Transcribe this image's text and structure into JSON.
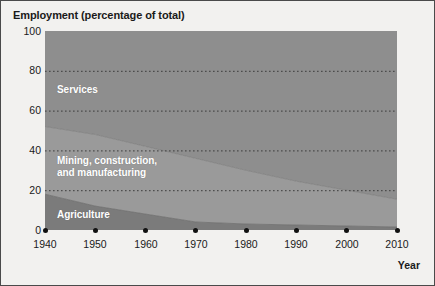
{
  "chart_data": {
    "type": "area",
    "title": "Employment (percentage of total)",
    "xlabel": "Year",
    "ylabel": "Employment (percentage of total)",
    "x": [
      1940,
      1950,
      1960,
      1970,
      1980,
      1990,
      2000,
      2010
    ],
    "xlim": [
      1940,
      2010
    ],
    "ylim": [
      0,
      100
    ],
    "xticks": [
      "1940",
      "1950",
      "1960",
      "1970",
      "1980",
      "1990",
      "2000",
      "2010"
    ],
    "yticks": [
      "0",
      "20",
      "40",
      "60",
      "80",
      "100"
    ],
    "grid": true,
    "grid_style": "dotted-horizontal",
    "legend": "inline-labels",
    "stacked": true,
    "stack_order_bottom_to_top": [
      "Agriculture",
      "Mining, construction, and manufacturing",
      "Services"
    ],
    "series": [
      {
        "name": "Agriculture",
        "color": "#7d7d7d",
        "values": [
          18,
          12,
          8,
          4,
          3,
          2.5,
          2,
          1.5
        ]
      },
      {
        "name": "Mining, construction, and manufacturing",
        "color": "#999999",
        "values": [
          34,
          36,
          34,
          32,
          27,
          22,
          18,
          14
        ]
      },
      {
        "name": "Services",
        "color": "#8e8e8e",
        "values": [
          48,
          52,
          58,
          64,
          70,
          75.5,
          80,
          84.5
        ]
      }
    ],
    "cumulative_upper_bounds": {
      "agriculture": [
        18,
        12,
        8,
        4,
        3,
        2.5,
        2,
        1.5
      ],
      "mining_manufacturing": [
        52,
        48,
        42,
        36,
        30,
        24.5,
        20,
        15.5
      ],
      "services": [
        100,
        100,
        100,
        100,
        100,
        100,
        100,
        100
      ]
    },
    "annotations": [
      {
        "text": "Services",
        "x": 1942.5,
        "y": 76
      },
      {
        "text": "Mining, construction,\nand manufacturing",
        "x": 1942.5,
        "y": 33
      },
      {
        "text": "Agriculture",
        "x": 1942.5,
        "y": 9
      }
    ]
  },
  "series_labels": {
    "services": "Services",
    "mining_line1": "Mining, construction,",
    "mining_line2": "and manufacturing",
    "agriculture": "Agriculture"
  },
  "axis": {
    "y_100": "100",
    "y_80": "80",
    "y_60": "60",
    "y_40": "40",
    "y_20": "20",
    "y_0": "0",
    "x_1940": "1940",
    "x_1950": "1950",
    "x_1960": "1960",
    "x_1970": "1970",
    "x_1980": "1980",
    "x_1990": "1990",
    "x_2000": "2000",
    "x_2010": "2010",
    "year_label": "Year"
  },
  "colors": {
    "background": "#f2f1ef",
    "border": "#4a4a4a",
    "agriculture": "#7d7d7d",
    "mining": "#999999",
    "services": "#8e8e8e",
    "text": "#1a1a1a",
    "label_text": "#ffffff",
    "gridline": "#3c3c3c"
  }
}
